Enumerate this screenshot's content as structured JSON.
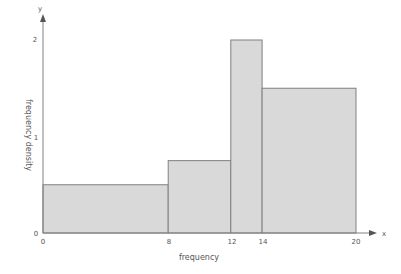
{
  "chart_data": {
    "type": "bar",
    "subtype": "histogram",
    "title": "",
    "xlabel": "frequency",
    "ylabel": "frequency density",
    "x_axis_symbol": "x",
    "y_axis_symbol": "y",
    "bins": [
      {
        "from": 0,
        "to": 8,
        "value": 0.5
      },
      {
        "from": 8,
        "to": 12,
        "value": 0.75
      },
      {
        "from": 12,
        "to": 14,
        "value": 2
      },
      {
        "from": 14,
        "to": 20,
        "value": 1.5
      }
    ],
    "categories": [
      "0-8",
      "8-12",
      "12-14",
      "14-20"
    ],
    "values": [
      0.5,
      0.75,
      2,
      1.5
    ],
    "x_ticks": [
      0,
      8,
      12,
      14,
      20
    ],
    "y_ticks": [
      0,
      1,
      2
    ],
    "xlim": [
      0,
      22
    ],
    "ylim": [
      0,
      2.1
    ],
    "grid": false,
    "legend": null,
    "colors": {
      "bar_fill": "#d9d9d9",
      "bar_stroke": "#808080",
      "axis": "#808080"
    }
  },
  "labels": {
    "xlabel": "frequency",
    "ylabel": "frequency density",
    "x_symbol": "x",
    "y_symbol": "y",
    "origin_y": "0",
    "y_tick_1": "1",
    "y_tick_2": "2",
    "x_tick_0": "0",
    "x_tick_8": "8",
    "x_tick_12": "12",
    "x_tick_14": "14",
    "x_tick_20": "20"
  }
}
